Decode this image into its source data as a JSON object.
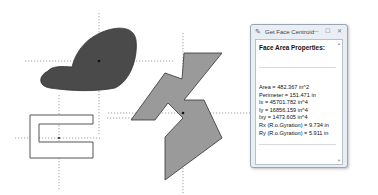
{
  "canvas": {
    "background": "#ffffff",
    "dark_fill": "#4a4a4a",
    "light_fill": "#9a9a9a",
    "outline": "#333333",
    "guide_color": "#8a8a8a"
  },
  "shapes": [
    {
      "name": "blob",
      "fill": "dark",
      "centroid": [
        99,
        61
      ]
    },
    {
      "name": "c-shape",
      "fill": "none",
      "centroid": [
        59,
        138
      ]
    },
    {
      "name": "zigzag-polygon",
      "fill": "light",
      "centroid": [
        183,
        113
      ]
    }
  ],
  "dialog": {
    "title": "Get Face Centroid",
    "heading": "Face Area Properties:",
    "properties": [
      "Area = 482.367 in^2",
      "Perimeter = 151.471 in",
      "Ix = 45701.782 in^4",
      "Iy = 16856.159 in^4",
      "Ixy = 1473.605 in^4",
      "Rx (R.o.Gyration) = 9.734 in",
      "Ry (R.o.Gyration) = 5.911 in"
    ],
    "buttons": {
      "minimize": "—",
      "maximize": "☐",
      "close": "✕"
    },
    "title_icon": "✎"
  }
}
